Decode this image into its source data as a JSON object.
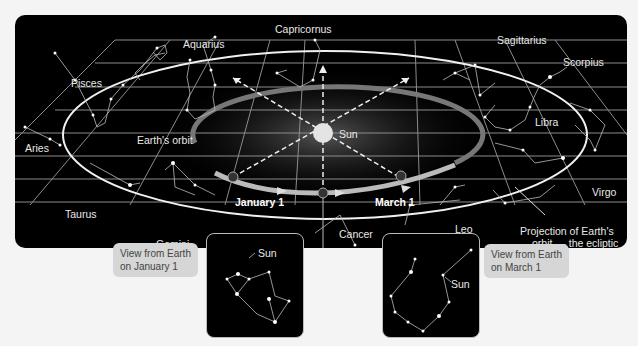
{
  "diagram": {
    "constellations": {
      "pisces": "Pisces",
      "aquarius": "Aquarius",
      "capricornus": "Capricornus",
      "sagittarius": "Sagittarius",
      "scorpius": "Scorpius",
      "libra": "Libra",
      "virgo": "Virgo",
      "leo": "Leo",
      "cancer": "Cancer",
      "gemini": "Gemini",
      "taurus": "Taurus",
      "aries": "Aries"
    },
    "labels": {
      "earths_orbit": "Earth's orbit",
      "sun": "Sun",
      "january": "January 1",
      "march": "March 1",
      "ecliptic_line1": "Projection of Earth's",
      "ecliptic_line2": "orbit — the ecliptic"
    },
    "insets": {
      "january": {
        "callout_line1": "View from Earth",
        "callout_line2": "on January 1",
        "sun_label": "Sun"
      },
      "march": {
        "callout_line1": "View from Earth",
        "callout_line2": "on March 1",
        "sun_label": "Sun"
      }
    },
    "colors": {
      "background": "#000000",
      "grid": "#9a9a9a",
      "ecliptic": "#f0f0f0",
      "callout": "#d6d6d6"
    }
  }
}
